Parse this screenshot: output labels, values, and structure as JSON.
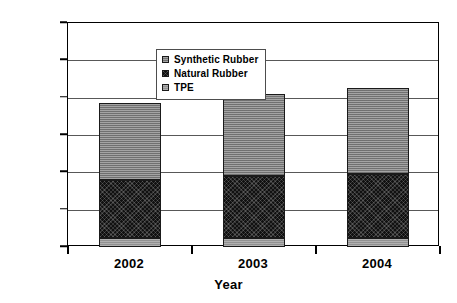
{
  "chart_data": {
    "type": "bar",
    "subtype": "stacked-column",
    "title": "",
    "xlabel": "Year",
    "ylabel": "",
    "categories": [
      "2002",
      "2003",
      "2004"
    ],
    "series": [
      {
        "name": "Synthetic Rubber",
        "values": [
          10300,
          11050,
          11500
        ],
        "color": "#7d7d7d",
        "pattern": "horizontal-hatch"
      },
      {
        "name": "Natural Rubber",
        "values": [
          7800,
          8300,
          8500
        ],
        "color": "#111111",
        "pattern": "dense-cross"
      },
      {
        "name": "TPE",
        "values": [
          1150,
          1200,
          1250
        ],
        "color": "#9a9a9a",
        "pattern": "light-fill"
      }
    ],
    "stack_order_bottom_to_top": [
      "TPE",
      "Natural Rubber",
      "Synthetic Rubber"
    ],
    "totals": [
      19250,
      20550,
      21250
    ],
    "ylim": [
      0,
      30000
    ],
    "yticks": [
      0,
      5000,
      10000,
      15000,
      20000,
      25000,
      30000
    ],
    "ytick_labels": [
      "0",
      "5,000",
      "10,000",
      "15,000",
      "20,000",
      "25,000",
      "30,000"
    ],
    "grid": true,
    "grid_axis": "y",
    "legend_position": "upper-left-inside"
  },
  "axes": {
    "y_title": "",
    "x_title": "Year"
  },
  "legend": {
    "entries": [
      {
        "label": "Synthetic Rubber",
        "swatch": "#7d7d7d"
      },
      {
        "label": "Natural Rubber",
        "swatch": "#111111"
      },
      {
        "label": "TPE",
        "swatch": "#9a9a9a"
      }
    ]
  }
}
